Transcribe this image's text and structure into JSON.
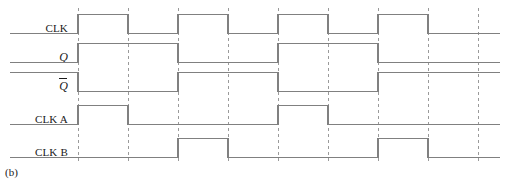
{
  "figure": {
    "caption": "(b)",
    "width": 512,
    "height": 185,
    "background": "#ffffff",
    "line_color": "#808080",
    "dash_color": "#9a9a9a",
    "text_color": "#1a1a1a"
  },
  "labels": {
    "clk": "CLK",
    "q": "Q",
    "qbar": "Q",
    "clk_a": "CLK A",
    "clk_b": "CLK B"
  },
  "chart_data": {
    "type": "line",
    "title": "(b)",
    "xlabel": "",
    "ylabel": "",
    "x_start": 10,
    "x_end": 500,
    "grid": true,
    "gridlines_style": "dashed-vertical",
    "gridlines_x": [
      78,
      128,
      178,
      228,
      278,
      328,
      378,
      428,
      478
    ],
    "legend_position": "left-labels",
    "period_px": 100,
    "half_period_px": 50,
    "signals": [
      {
        "name": "CLK",
        "label": "CLK",
        "row_y_high": 14,
        "row_y_low": 33,
        "initial_level": 0,
        "transitions": [
          {
            "x": 78,
            "level": 1
          },
          {
            "x": 128,
            "level": 0
          },
          {
            "x": 178,
            "level": 1
          },
          {
            "x": 228,
            "level": 0
          },
          {
            "x": 278,
            "level": 1
          },
          {
            "x": 328,
            "level": 0
          },
          {
            "x": 378,
            "level": 1
          },
          {
            "x": 428,
            "level": 0
          }
        ]
      },
      {
        "name": "Q",
        "label": "Q",
        "row_y_high": 43,
        "row_y_low": 62,
        "initial_level": 0,
        "transitions": [
          {
            "x": 78,
            "level": 1
          },
          {
            "x": 178,
            "level": 0
          },
          {
            "x": 278,
            "level": 1
          },
          {
            "x": 378,
            "level": 0
          }
        ]
      },
      {
        "name": "Qbar",
        "label": "Q",
        "overbar": true,
        "row_y_high": 72,
        "row_y_low": 91,
        "initial_level": 1,
        "transitions": [
          {
            "x": 78,
            "level": 0
          },
          {
            "x": 178,
            "level": 1
          },
          {
            "x": 278,
            "level": 0
          },
          {
            "x": 378,
            "level": 1
          }
        ]
      },
      {
        "name": "CLK A",
        "label": "CLK A",
        "row_y_high": 105,
        "row_y_low": 124,
        "initial_level": 0,
        "transitions": [
          {
            "x": 78,
            "level": 1
          },
          {
            "x": 128,
            "level": 0
          },
          {
            "x": 278,
            "level": 1
          },
          {
            "x": 328,
            "level": 0
          }
        ]
      },
      {
        "name": "CLK B",
        "label": "CLK B",
        "row_y_high": 138,
        "row_y_low": 157,
        "initial_level": 0,
        "transitions": [
          {
            "x": 178,
            "level": 1
          },
          {
            "x": 228,
            "level": 0
          },
          {
            "x": 378,
            "level": 1
          },
          {
            "x": 428,
            "level": 0
          }
        ]
      }
    ],
    "label_positions": [
      {
        "key": "clk",
        "right": 68,
        "center_y": 28
      },
      {
        "key": "q",
        "right": 68,
        "center_y": 57
      },
      {
        "key": "qbar",
        "right": 68,
        "center_y": 86
      },
      {
        "key": "clk_a",
        "right": 68,
        "center_y": 119
      },
      {
        "key": "clk_b",
        "right": 68,
        "center_y": 152
      }
    ]
  }
}
